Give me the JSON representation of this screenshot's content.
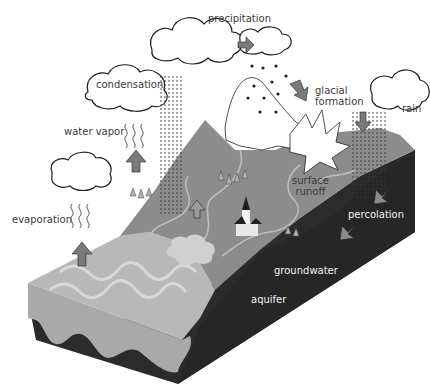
{
  "diagram": {
    "topic": "water cycle",
    "labels": {
      "precipitation": "precipitation",
      "condensation": "condensation",
      "water_vapor": "water vapor",
      "evaporation": "evaporation",
      "glacial_formation_line1": "glacial",
      "glacial_formation_line2": "formation",
      "rain": "rain",
      "surface_runoff_line1": "surface",
      "surface_runoff_line2": "runoff",
      "percolation": "percolation",
      "groundwater": "groundwater",
      "aquifer": "aquifer"
    },
    "colors": {
      "background": "#ffffff",
      "land_surface": "#8c8c8c",
      "ocean_surface": "#b4b4b4",
      "ocean_wave": "#d6d6d6",
      "front_face_sand": "#a9a9a9",
      "bedrock_dark": "#2b2b2b",
      "snow": "#ffffff",
      "arrow_fill": "#7a7a7a",
      "cloud_outline": "#1e1e1e",
      "text": "#3a3a3a",
      "text_on_dark": "#f2f2f2"
    }
  }
}
